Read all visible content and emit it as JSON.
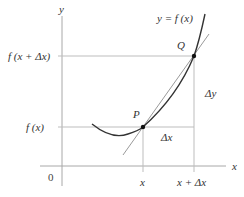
{
  "diagram": {
    "type": "derivative-secant-tangent",
    "colors": {
      "axis": "#a8a8a8",
      "guide": "#bdbdbd",
      "curve": "#333333",
      "tangent": "#9a9a9a",
      "point": "#111111",
      "text": "#333333"
    },
    "axes": {
      "x_label": "x",
      "y_label": "y",
      "origin_label": "0"
    },
    "curve_label": "y = f (x)",
    "points": [
      {
        "name": "P",
        "label": "P"
      },
      {
        "name": "Q",
        "label": "Q"
      }
    ],
    "x_ticks": [
      {
        "label": "x"
      },
      {
        "label": "x + Δx"
      }
    ],
    "y_ticks": [
      {
        "label": "f (x)"
      },
      {
        "label": "f (x + Δx)"
      }
    ],
    "increments": {
      "dx_label": "Δx",
      "dy_label": "Δy"
    }
  }
}
